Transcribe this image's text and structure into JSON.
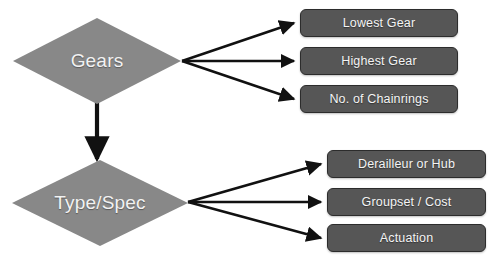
{
  "diagram": {
    "title_fragment": "",
    "background_color": "#ffffff",
    "diamond_fill": "#888888",
    "box_fill": "#565656",
    "box_border": "#2c2c2c",
    "arrow_color": "#111111",
    "text_color": "#f4f4f4",
    "nodes": {
      "gears": {
        "label": "Gears",
        "shape": "diamond"
      },
      "type_spec": {
        "label": "Type/Spec",
        "shape": "diamond"
      }
    },
    "gears_branches": [
      {
        "label": "Lowest Gear"
      },
      {
        "label": "Highest Gear"
      },
      {
        "label": "No. of Chainrings"
      }
    ],
    "type_spec_branches": [
      {
        "label": "Derailleur or Hub"
      },
      {
        "label": "Groupset / Cost"
      },
      {
        "label": "Actuation"
      }
    ]
  }
}
